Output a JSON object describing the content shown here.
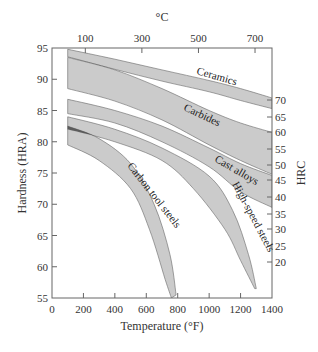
{
  "chart_data": {
    "type": "area",
    "title": "",
    "xlabel": "Temperature (°F)",
    "ylabel": "Hardness (HRA)",
    "x2label": "°C",
    "y2label": "HRC",
    "xlim": [
      0,
      1400
    ],
    "ylim": [
      55,
      95
    ],
    "x_ticks": [
      0,
      200,
      400,
      600,
      800,
      1000,
      1200,
      1400
    ],
    "y_ticks": [
      55,
      60,
      65,
      70,
      75,
      80,
      85,
      90,
      95
    ],
    "x2_ticks": [
      100,
      300,
      500,
      700
    ],
    "y2_ticks": [
      20,
      25,
      30,
      35,
      40,
      45,
      50,
      55,
      60,
      65,
      70
    ],
    "grid": false,
    "legend": "inline labels",
    "series": [
      {
        "name": "Ceramics",
        "upper": [
          [
            100,
            94.8
          ],
          [
            400,
            93.2
          ],
          [
            700,
            91.5
          ],
          [
            1000,
            89.8
          ],
          [
            1200,
            88.5
          ],
          [
            1400,
            87.0
          ]
        ],
        "lower": [
          [
            100,
            93.6
          ],
          [
            400,
            91.6
          ],
          [
            700,
            89.7
          ],
          [
            1000,
            88.0
          ],
          [
            1200,
            86.6
          ],
          [
            1400,
            85.3
          ]
        ]
      },
      {
        "name": "Carbides",
        "upper": [
          [
            100,
            93.5
          ],
          [
            400,
            91.5
          ],
          [
            700,
            88.5
          ],
          [
            1000,
            85.0
          ],
          [
            1200,
            83.0
          ],
          [
            1400,
            81.5
          ]
        ],
        "lower": [
          [
            100,
            88.5
          ],
          [
            400,
            86.5
          ],
          [
            700,
            83.5
          ],
          [
            1000,
            79.5
          ],
          [
            1200,
            77.0
          ],
          [
            1400,
            74.8
          ]
        ]
      },
      {
        "name": "Cast alloys",
        "upper": [
          [
            100,
            86.8
          ],
          [
            400,
            85.0
          ],
          [
            700,
            82.5
          ],
          [
            1000,
            79.0
          ],
          [
            1200,
            76.5
          ],
          [
            1400,
            74.6
          ]
        ],
        "lower": [
          [
            100,
            84.5
          ],
          [
            400,
            83.0
          ],
          [
            700,
            80.0
          ],
          [
            1000,
            76.0
          ],
          [
            1200,
            72.0
          ],
          [
            1400,
            69.5
          ]
        ]
      },
      {
        "name": "High-speed steels",
        "upper": [
          [
            100,
            84.0
          ],
          [
            400,
            82.0
          ],
          [
            700,
            79.0
          ],
          [
            1000,
            74.5
          ],
          [
            1150,
            69.0
          ],
          [
            1250,
            62.0
          ],
          [
            1300,
            56.5
          ]
        ],
        "lower": [
          [
            100,
            82.0
          ],
          [
            400,
            80.0
          ],
          [
            700,
            77.0
          ],
          [
            900,
            72.5
          ],
          [
            1100,
            66.0
          ],
          [
            1200,
            61.0
          ],
          [
            1290,
            56.5
          ]
        ]
      },
      {
        "name": "Carbon tool steels",
        "upper": [
          [
            100,
            82.5
          ],
          [
            300,
            80.5
          ],
          [
            500,
            76.5
          ],
          [
            650,
            70.0
          ],
          [
            750,
            62.0
          ],
          [
            790,
            55.5
          ]
        ],
        "lower": [
          [
            100,
            79.5
          ],
          [
            300,
            77.0
          ],
          [
            500,
            72.5
          ],
          [
            620,
            66.0
          ],
          [
            720,
            58.0
          ],
          [
            760,
            55.0
          ]
        ]
      }
    ],
    "annotations": [
      "Ceramics",
      "Carbides",
      "Cast alloys",
      "High-speed steels",
      "Carbon tool steels"
    ]
  },
  "labels": {
    "top_axis_title": "°C",
    "bottom_axis_title": "Temperature (°F)",
    "left_axis_title": "Hardness (HRA)",
    "right_axis_title": "HRC",
    "ceramics": "Ceramics",
    "carbides": "Carbides",
    "cast_alloys": "Cast alloys",
    "high_speed_steels": "High-speed steels",
    "carbon_tool_steels": "Carbon tool steels"
  },
  "colors": {
    "band_light": "#c2c2c2",
    "band_dark": "#4a4a4a",
    "band_mid": "#8f8f8f",
    "axis": "#555555"
  }
}
